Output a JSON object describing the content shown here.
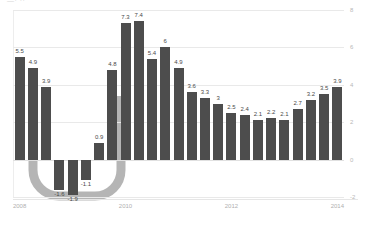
{
  "artifact": {
    "top_crop_text": "—· ··"
  },
  "chart_data": {
    "type": "bar",
    "title": "",
    "subtitle": "",
    "xlabel": "",
    "ylabel": "",
    "ylim": [
      -2,
      8
    ],
    "yticks": [
      "8",
      "6",
      "4",
      "2",
      "0",
      "-2"
    ],
    "ytick_values": [
      8,
      6,
      4,
      2,
      0,
      -2
    ],
    "grid": true,
    "y_axis_position": "right",
    "legend": "none",
    "x_axis_ticks": [
      "2008",
      "2010",
      "2012",
      "2014"
    ],
    "x_axis_tick_indices": [
      0,
      8,
      16,
      24
    ],
    "categories": [
      "2008Q1",
      "2008Q2",
      "2008Q3",
      "2008Q4",
      "2009Q1",
      "2009Q2",
      "2009Q3",
      "2009Q4",
      "2010Q1",
      "2010Q2",
      "2010Q3",
      "2010Q4",
      "2011Q1",
      "2011Q2",
      "2011Q3",
      "2011Q4",
      "2012Q1",
      "2012Q2",
      "2012Q3",
      "2012Q4",
      "2013Q1",
      "2013Q2",
      "2013Q3",
      "2013Q4",
      "2014Q1"
    ],
    "values": [
      5.5,
      4.9,
      3.9,
      -1.6,
      -1.9,
      -1.1,
      0.9,
      4.8,
      7.3,
      7.4,
      5.4,
      6,
      4.9,
      3.6,
      3.3,
      3,
      2.5,
      2.4,
      2.1,
      2.2,
      2.1,
      2.7,
      3.2,
      3.5,
      3.9
    ],
    "value_labels": [
      "5.5",
      "4.9",
      "3.9",
      "-1.6",
      "-1.9",
      "-1.1",
      "0.9",
      "4.8",
      "7.3",
      "7.4",
      "5.4",
      "6",
      "4.9",
      "3.6",
      "3.3",
      "3",
      "2.5",
      "2.4",
      "2.1",
      "2.2",
      "2.1",
      "2.7",
      "3.2",
      "3.5",
      "3.9"
    ],
    "bar_color": "#4d4d4d",
    "annotation": {
      "name": "u-shape-highlight",
      "shape": "u-curve",
      "color": "#b5b5b5",
      "spans_from_index": 1,
      "spans_to_index": 7,
      "description": "Thick grey U-shaped band sweeping from the 2008Q2 bar down beneath the negative bars and back up to the 2009Q4 bar"
    }
  }
}
